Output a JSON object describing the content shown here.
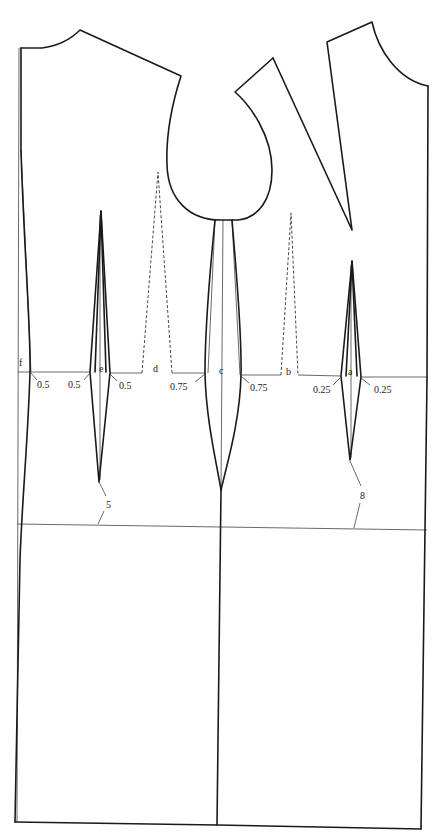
{
  "diagram": {
    "title_cut": "",
    "type": "dress bodice pattern draft (front and back) with darts",
    "point_labels": {
      "f": "f",
      "e": "e",
      "d": "d",
      "c": "c",
      "b": "b",
      "a": "a"
    },
    "measurements": {
      "f_right": "0.5",
      "e_left": "0.5",
      "e_right": "0.5",
      "d_right": "0.75",
      "c_right": "0.75",
      "a_left": "0.25",
      "a_right": "0.25",
      "left_dart_drop": "5",
      "right_dart_drop": "8"
    },
    "colors": {
      "line": "#1a1a1a",
      "guide": "#444444",
      "background": "#ffffff"
    }
  }
}
